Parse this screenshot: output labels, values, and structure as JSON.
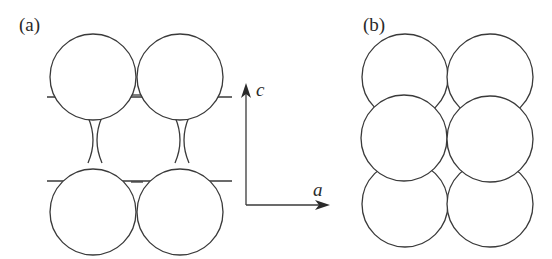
{
  "figure": {
    "panel_a": {
      "label": "(a)",
      "description": "Four circles in a square arrangement with neck/cusp connections and horizontal bond stubs"
    },
    "panel_b": {
      "label": "(b)",
      "description": "Six overlapping circles in two columns and three rows"
    },
    "axes": {
      "vertical_label": "c",
      "horizontal_label": "a"
    },
    "colors": {
      "stroke": "#3a3a3a",
      "background": "#ffffff"
    }
  }
}
